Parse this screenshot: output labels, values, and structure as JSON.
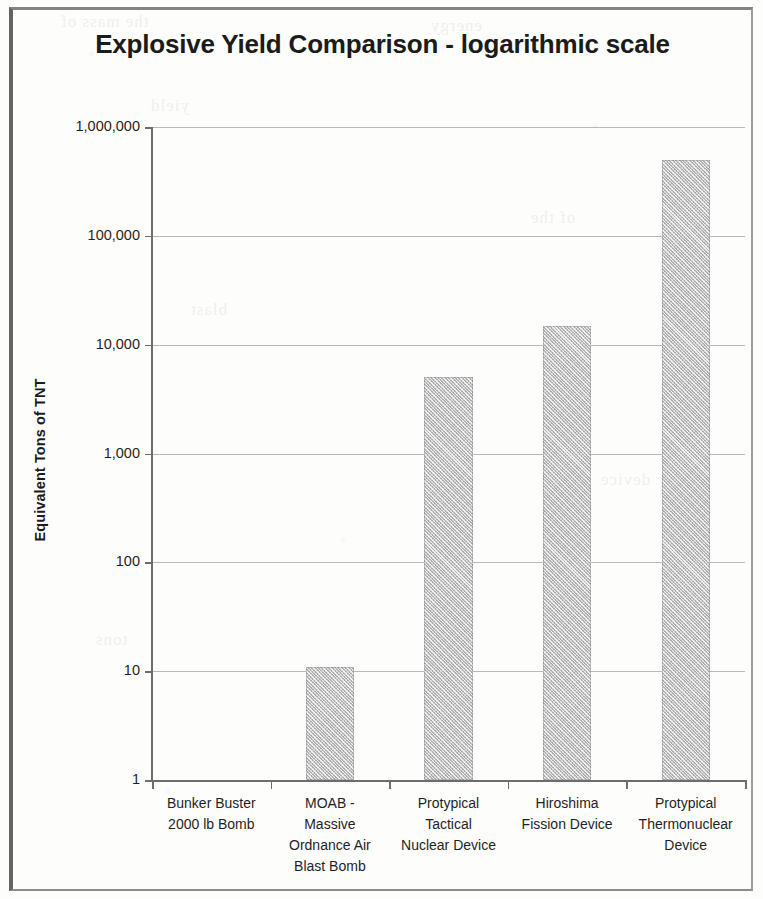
{
  "chart_data": {
    "type": "bar",
    "title": "Explosive Yield Comparison - logarithmic scale",
    "xlabel": "",
    "ylabel": "Equivalent Tons of TNT",
    "scale": "log",
    "grid": true,
    "legend": "none",
    "ylim": [
      1,
      1000000
    ],
    "ytick_labels": [
      "1,000,000",
      "100,000",
      "10,000",
      "1,000",
      "100",
      "10",
      "1"
    ],
    "ytick_values": [
      1000000,
      100000,
      10000,
      1000,
      100,
      10,
      1
    ],
    "categories": [
      "Bunker Buster 2000 lb Bomb",
      "MOAB - Massive Ordnance Air Blast Bomb",
      "Protypical Tactical Nuclear Device",
      "Hiroshima Fission Device",
      "Protypical Thermonuclear Device"
    ],
    "category_lines": [
      [
        "Bunker Buster",
        "2000 lb Bomb"
      ],
      [
        "MOAB -",
        "Massive",
        "Ordnance Air",
        "Blast Bomb"
      ],
      [
        "Protypical",
        "Tactical",
        "Nuclear Device"
      ],
      [
        "Hiroshima",
        "Fission Device"
      ],
      [
        "Protypical",
        "Thermonuclear",
        "Device"
      ]
    ],
    "values": [
      1,
      11,
      5000,
      15000,
      500000
    ],
    "bar_color": "#ababab"
  },
  "colors": {
    "bar": "#ababab",
    "gridline": "#b9b9b9",
    "axis": "#6d6d6d",
    "text": "#1f1f1f",
    "title": "#1b1b1b"
  },
  "ghost_text": [
    "the mass of",
    "energy",
    "yield",
    "of the",
    "blast",
    "device",
    "tons"
  ]
}
